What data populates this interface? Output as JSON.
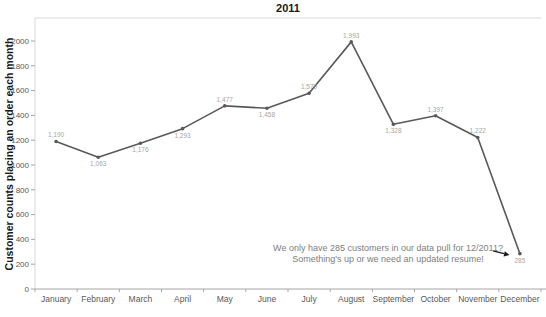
{
  "chart_data": {
    "type": "line",
    "title": "2011",
    "xlabel": "",
    "ylabel": "Customer counts placing an order each month",
    "categories": [
      "January",
      "February",
      "March",
      "April",
      "May",
      "June",
      "July",
      "August",
      "September",
      "October",
      "November",
      "December"
    ],
    "series": [
      {
        "name": "Customer counts",
        "values": [
          1190,
          1063,
          1176,
          1293,
          1477,
          1458,
          1579,
          1993,
          1328,
          1397,
          1222,
          285
        ]
      }
    ],
    "value_labels": [
      "1,190",
      "1,063",
      "1,176",
      "1,293",
      "1,477",
      "1,458",
      "1,579",
      "1,993",
      "1,328",
      "1,397",
      "1,222",
      "285"
    ],
    "label_positions": [
      "above",
      "below",
      "below",
      "below",
      "above",
      "below",
      "above",
      "above",
      "below",
      "above",
      "above",
      "below"
    ],
    "ylim": [
      0,
      2000
    ],
    "ytick_interval": 200,
    "ytick_labels": [
      "0",
      "200",
      "400",
      "600",
      "800",
      "1000",
      "1200",
      "1400",
      "1600",
      "1800",
      "2000"
    ],
    "grid": false,
    "legend": "none",
    "line_color": "#595959",
    "marker_color": "#595959",
    "label_color": "#a6a6a6",
    "axis_color": "#a6a6a6",
    "border_color": "#d9d9d9",
    "tick_text_color": "#595959"
  },
  "annotation": {
    "line1": "We only have 285 customers in our data pull for 12/2011?",
    "line2": "Something's up or we need an updated resume!",
    "color": "#808080",
    "arrow_color": "#1a1a1a",
    "arrow_icon": "right-arrow"
  }
}
